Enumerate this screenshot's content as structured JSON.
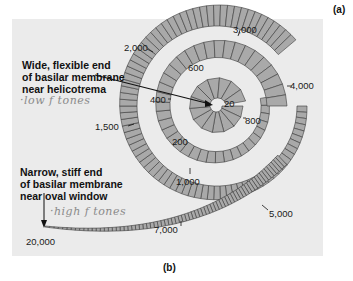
{
  "panel_labels": {
    "a": "(a)",
    "b": "(b)"
  },
  "annotations": {
    "wide_end": [
      "Wide, flexible end",
      "of basilar membrane",
      "near helicotrema"
    ],
    "wide_end_handwritten": "·low f tones",
    "narrow_end": [
      "Narrow, stiff end",
      "of basilar membrane",
      "near oval window"
    ],
    "narrow_end_handwritten": "·high f tones"
  },
  "frequency_labels": [
    {
      "text": "20",
      "hz": 20
    },
    {
      "text": "200",
      "hz": 200
    },
    {
      "text": "400",
      "hz": 400
    },
    {
      "text": "600",
      "hz": 600
    },
    {
      "text": "800",
      "hz": 800
    },
    {
      "text": "1,000",
      "hz": 1000
    },
    {
      "text": "1,500",
      "hz": 1500
    },
    {
      "text": "2,000",
      "hz": 2000
    },
    {
      "text": "3,000",
      "hz": 3000
    },
    {
      "text": "4,000",
      "hz": 4000
    },
    {
      "text": "5,000",
      "hz": 5000
    },
    {
      "text": "7,000",
      "hz": 7000
    },
    {
      "text": "20,000",
      "hz": 20000
    }
  ],
  "colors": {
    "background": "#ffffff",
    "panel": "#ebebeb",
    "membrane_fill": "#a9a9a9",
    "membrane_stroke": "#3a3a3a",
    "text": "#1a1a1a",
    "handwriting": "#8a8a8a"
  }
}
